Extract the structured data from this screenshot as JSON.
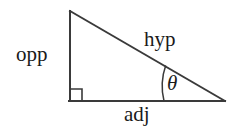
{
  "diagram": {
    "type": "right-triangle",
    "background_color": "#ffffff",
    "stroke_color": "#3a3a3a",
    "text_color": "#1a1a1a",
    "stroke_width": 2,
    "labels": {
      "opposite": "opp",
      "hypotenuse": "hyp",
      "adjacent": "adj",
      "angle": "θ"
    },
    "vertices": {
      "apex": {
        "x": 70,
        "y": 11
      },
      "right_angle": {
        "x": 70,
        "y": 101
      },
      "angle_vertex": {
        "x": 225,
        "y": 101
      }
    },
    "right_angle_marker": {
      "name": "right-angle-square",
      "x": 70,
      "y": 89,
      "size": 12
    },
    "angle_arc": {
      "name": "theta-arc",
      "center_x": 225,
      "center_y": 101,
      "radius": 62,
      "start_x": 164,
      "start_y": 101,
      "end_x": 165.7,
      "end_y": 65.6
    },
    "sides": {
      "opposite": {
        "x1": 70,
        "y1": 11,
        "x2": 70,
        "y2": 101
      },
      "adjacent": {
        "x1": 70,
        "y1": 101,
        "x2": 225,
        "y2": 101
      },
      "hypotenuse": {
        "x1": 70,
        "y1": 11,
        "x2": 225,
        "y2": 101
      }
    }
  }
}
